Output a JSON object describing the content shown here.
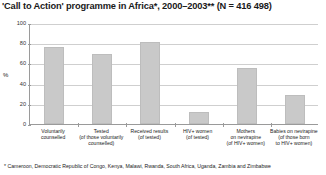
{
  "chart_data": {
    "type": "bar",
    "title": "'Call to Action' programme in Africa*, 2000–2003** (N = 416 498)",
    "xlabel": "",
    "ylabel": "%",
    "ylim": [
      0,
      100
    ],
    "yticks": [
      "0",
      "20",
      "40",
      "60",
      "80",
      "100"
    ],
    "grid": true,
    "legend": "none",
    "categories": [
      "Voluntarily counselled",
      "Tested (of those voluntarily counselled)",
      "Received results (of tested)",
      "HIV+ women (of tested)",
      "Mothers on nevirapine (of HIV+ women)",
      "Babies on nevirapine (of those born to HIV+ women)"
    ],
    "category_lines": [
      [
        "Voluntarily",
        "counselled"
      ],
      [
        "Tested",
        "(of those voluntarily",
        "counselled)"
      ],
      [
        "Received results",
        "(of tested)"
      ],
      [
        "HIV+ women",
        "(of tested)"
      ],
      [
        "Mothers",
        "on nevirapine",
        "(of HIV+ women)"
      ],
      [
        "Babies on nevirapine",
        "(of those born",
        "to HIV+ women)"
      ]
    ],
    "values": [
      76,
      69,
      81,
      12,
      55,
      29
    ],
    "bar_color": "#c9c9c9",
    "axis_color": "#9a9a9a",
    "grid_color": "#cfcfcf"
  },
  "footnote": "* Cameroon, Democratic Republic of Congo, Kenya, Malawi, Rwanda, South Africa, Uganda, Zambia and Zimbabwe"
}
